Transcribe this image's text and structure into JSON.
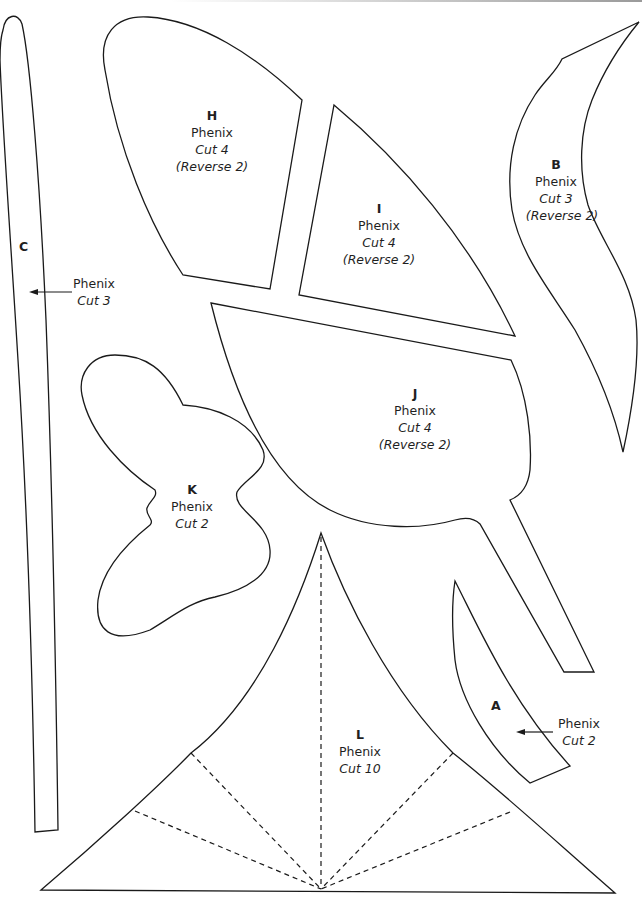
{
  "page": {
    "line_color": "#1a1a1a",
    "background": "#ffffff"
  },
  "pieces": {
    "H": {
      "letter": "H",
      "fabric": "Phenix",
      "cut": "Cut 4",
      "reverse": "(Reverse 2)"
    },
    "I": {
      "letter": "I",
      "fabric": "Phenix",
      "cut": "Cut 4",
      "reverse": "(Reverse 2)"
    },
    "B": {
      "letter": "B",
      "fabric": "Phenix",
      "cut": "Cut 3",
      "reverse": "(Reverse 2)"
    },
    "C": {
      "letter": "C",
      "fabric": "Phenix",
      "cut": "Cut 3"
    },
    "J": {
      "letter": "J",
      "fabric": "Phenix",
      "cut": "Cut 4",
      "reverse": "(Reverse 2)"
    },
    "K": {
      "letter": "K",
      "fabric": "Phenix",
      "cut": "Cut 2"
    },
    "A": {
      "letter": "A",
      "fabric": "Phenix",
      "cut": "Cut 2"
    },
    "L": {
      "letter": "L",
      "fabric": "Phenix",
      "cut": "Cut 10"
    }
  },
  "annotations": {
    "fold_lines": "dashed",
    "pointer_arrows": [
      "C",
      "A"
    ]
  }
}
